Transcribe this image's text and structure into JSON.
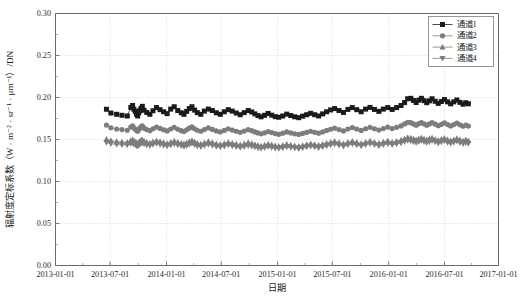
{
  "chart_data": {
    "type": "line",
    "title": "",
    "xlabel": "日期",
    "ylabel": "辐射度定标系数（W · m⁻² · sr⁻¹ · μm⁻¹）/DN",
    "xlim": [
      "2013-01-01",
      "2017-01-01"
    ],
    "ylim": [
      0.0,
      0.3
    ],
    "ytick_labels": [
      "0.00",
      "0.05",
      "0.10",
      "0.15",
      "0.20",
      "0.25",
      "0.30"
    ],
    "ytick_values": [
      0.0,
      0.05,
      0.1,
      0.15,
      0.2,
      0.25,
      0.3
    ],
    "xtick_labels": [
      "2013-01-01",
      "2013-07-01",
      "2014-01-01",
      "2014-07-01",
      "2015-01-01",
      "2015-07-01",
      "2016-01-01",
      "2016-07-01",
      "2017-01-01"
    ],
    "xtick_values": [
      0.0,
      0.1233,
      0.2507,
      0.374,
      0.5014,
      0.6247,
      0.7521,
      0.8781,
      1.0
    ],
    "grid": true,
    "legend_position": "top-right",
    "series": [
      {
        "name": "通道1",
        "marker": "square",
        "color": "#1a1a1a",
        "x": [
          0.115,
          0.125,
          0.138,
          0.15,
          0.162,
          0.17,
          0.174,
          0.177,
          0.18,
          0.183,
          0.1855,
          0.188,
          0.1905,
          0.193,
          0.196,
          0.2,
          0.206,
          0.213,
          0.22,
          0.228,
          0.236,
          0.244,
          0.252,
          0.26,
          0.268,
          0.276,
          0.284,
          0.29,
          0.296,
          0.302,
          0.308,
          0.314,
          0.32,
          0.328,
          0.336,
          0.345,
          0.354,
          0.363,
          0.372,
          0.381,
          0.39,
          0.399,
          0.408,
          0.417,
          0.426,
          0.435,
          0.443,
          0.45,
          0.457,
          0.464,
          0.472,
          0.48,
          0.488,
          0.496,
          0.504,
          0.513,
          0.522,
          0.531,
          0.54,
          0.549,
          0.558,
          0.567,
          0.576,
          0.585,
          0.594,
          0.603,
          0.612,
          0.621,
          0.63,
          0.64,
          0.65,
          0.66,
          0.67,
          0.68,
          0.69,
          0.7,
          0.71,
          0.72,
          0.73,
          0.74,
          0.75,
          0.76,
          0.77,
          0.78,
          0.788,
          0.795,
          0.802,
          0.808,
          0.814,
          0.82,
          0.826,
          0.832,
          0.838,
          0.844,
          0.85,
          0.857,
          0.864,
          0.871,
          0.878,
          0.885,
          0.892,
          0.899,
          0.906,
          0.913,
          0.92,
          0.926,
          0.932
        ],
        "y": [
          0.186,
          0.1815,
          0.18,
          0.1788,
          0.178,
          0.1882,
          0.1905,
          0.186,
          0.1835,
          0.18,
          0.178,
          0.1818,
          0.1845,
          0.187,
          0.1895,
          0.1848,
          0.1822,
          0.18,
          0.1842,
          0.188,
          0.1855,
          0.183,
          0.1808,
          0.1862,
          0.189,
          0.1845,
          0.1818,
          0.18,
          0.1835,
          0.1868,
          0.189,
          0.185,
          0.182,
          0.18,
          0.1838,
          0.1862,
          0.1845,
          0.1818,
          0.18,
          0.183,
          0.1855,
          0.1838,
          0.1815,
          0.1795,
          0.182,
          0.1845,
          0.1828,
          0.1805,
          0.1785,
          0.177,
          0.1788,
          0.181,
          0.179,
          0.1772,
          0.1765,
          0.178,
          0.1802,
          0.1785,
          0.177,
          0.176,
          0.1778,
          0.1795,
          0.1812,
          0.1795,
          0.178,
          0.1805,
          0.183,
          0.1852,
          0.1868,
          0.1845,
          0.1822,
          0.1858,
          0.188,
          0.1855,
          0.183,
          0.1862,
          0.1882,
          0.1858,
          0.1835,
          0.1862,
          0.188,
          0.1858,
          0.188,
          0.1905,
          0.194,
          0.1985,
          0.199,
          0.1965,
          0.194,
          0.1968,
          0.199,
          0.1962,
          0.1938,
          0.196,
          0.1985,
          0.1955,
          0.193,
          0.1952,
          0.1975,
          0.1948,
          0.1925,
          0.1948,
          0.197,
          0.1942,
          0.192,
          0.1938,
          0.1925
        ]
      },
      {
        "name": "通道2",
        "marker": "circle",
        "color": "#7d7d7d",
        "x": [
          0.115,
          0.125,
          0.138,
          0.15,
          0.162,
          0.17,
          0.174,
          0.177,
          0.18,
          0.183,
          0.1855,
          0.188,
          0.1905,
          0.193,
          0.196,
          0.2,
          0.206,
          0.213,
          0.22,
          0.228,
          0.236,
          0.244,
          0.252,
          0.26,
          0.268,
          0.276,
          0.284,
          0.29,
          0.296,
          0.302,
          0.308,
          0.314,
          0.32,
          0.328,
          0.336,
          0.345,
          0.354,
          0.363,
          0.372,
          0.381,
          0.39,
          0.399,
          0.408,
          0.417,
          0.426,
          0.435,
          0.443,
          0.45,
          0.457,
          0.464,
          0.472,
          0.48,
          0.488,
          0.496,
          0.504,
          0.513,
          0.522,
          0.531,
          0.54,
          0.549,
          0.558,
          0.567,
          0.576,
          0.585,
          0.594,
          0.603,
          0.612,
          0.621,
          0.63,
          0.64,
          0.65,
          0.66,
          0.67,
          0.68,
          0.69,
          0.7,
          0.71,
          0.72,
          0.73,
          0.74,
          0.75,
          0.76,
          0.77,
          0.78,
          0.788,
          0.795,
          0.802,
          0.808,
          0.814,
          0.82,
          0.826,
          0.832,
          0.838,
          0.844,
          0.85,
          0.857,
          0.864,
          0.871,
          0.878,
          0.885,
          0.892,
          0.899,
          0.906,
          0.913,
          0.92,
          0.926,
          0.932
        ],
        "y": [
          0.1672,
          0.164,
          0.1625,
          0.1618,
          0.161,
          0.1648,
          0.1662,
          0.164,
          0.1622,
          0.1608,
          0.1598,
          0.1618,
          0.1635,
          0.165,
          0.1662,
          0.1635,
          0.1618,
          0.1605,
          0.1628,
          0.1648,
          0.1632,
          0.1615,
          0.1602,
          0.1625,
          0.1645,
          0.1622,
          0.1605,
          0.1595,
          0.1615,
          0.1635,
          0.165,
          0.1628,
          0.161,
          0.1598,
          0.1618,
          0.1638,
          0.162,
          0.1602,
          0.159,
          0.1608,
          0.1628,
          0.1612,
          0.1598,
          0.1585,
          0.16,
          0.1618,
          0.1605,
          0.159,
          0.1578,
          0.1568,
          0.158,
          0.1595,
          0.1582,
          0.157,
          0.1562,
          0.1575,
          0.159,
          0.1578,
          0.1568,
          0.156,
          0.1572,
          0.1585,
          0.1598,
          0.1585,
          0.1575,
          0.159,
          0.1608,
          0.1622,
          0.1635,
          0.1618,
          0.1602,
          0.1625,
          0.1642,
          0.1625,
          0.1608,
          0.1628,
          0.1645,
          0.1628,
          0.1612,
          0.163,
          0.1648,
          0.163,
          0.1645,
          0.1662,
          0.1685,
          0.1705,
          0.17,
          0.1685,
          0.167,
          0.1688,
          0.1702,
          0.1685,
          0.167,
          0.1685,
          0.1702,
          0.1682,
          0.1665,
          0.168,
          0.1698,
          0.1678,
          0.1662,
          0.1678,
          0.1695,
          0.1675,
          0.1658,
          0.1672,
          0.166
        ]
      },
      {
        "name": "通道3",
        "marker": "triangle-up",
        "color": "#7d7d7d",
        "x": [
          0.115,
          0.125,
          0.138,
          0.15,
          0.162,
          0.17,
          0.174,
          0.177,
          0.18,
          0.183,
          0.1855,
          0.188,
          0.1905,
          0.193,
          0.196,
          0.2,
          0.206,
          0.213,
          0.22,
          0.228,
          0.236,
          0.244,
          0.252,
          0.26,
          0.268,
          0.276,
          0.284,
          0.29,
          0.296,
          0.302,
          0.308,
          0.314,
          0.32,
          0.328,
          0.336,
          0.345,
          0.354,
          0.363,
          0.372,
          0.381,
          0.39,
          0.399,
          0.408,
          0.417,
          0.426,
          0.435,
          0.443,
          0.45,
          0.457,
          0.464,
          0.472,
          0.48,
          0.488,
          0.496,
          0.504,
          0.513,
          0.522,
          0.531,
          0.54,
          0.549,
          0.558,
          0.567,
          0.576,
          0.585,
          0.594,
          0.603,
          0.612,
          0.621,
          0.63,
          0.64,
          0.65,
          0.66,
          0.67,
          0.68,
          0.69,
          0.7,
          0.71,
          0.72,
          0.73,
          0.74,
          0.75,
          0.76,
          0.77,
          0.78,
          0.788,
          0.795,
          0.802,
          0.808,
          0.814,
          0.82,
          0.826,
          0.832,
          0.838,
          0.844,
          0.85,
          0.857,
          0.864,
          0.871,
          0.878,
          0.885,
          0.892,
          0.899,
          0.906,
          0.913,
          0.92,
          0.926,
          0.932
        ],
        "y": [
          0.1505,
          0.1488,
          0.1478,
          0.1472,
          0.1468,
          0.149,
          0.1498,
          0.1485,
          0.1472,
          0.1462,
          0.1455,
          0.1468,
          0.148,
          0.1492,
          0.15,
          0.1482,
          0.147,
          0.146,
          0.1475,
          0.1488,
          0.1478,
          0.1465,
          0.1455,
          0.147,
          0.1485,
          0.147,
          0.1458,
          0.145,
          0.1462,
          0.1478,
          0.149,
          0.1472,
          0.1458,
          0.1448,
          0.1462,
          0.1478,
          0.1465,
          0.1452,
          0.1442,
          0.1455,
          0.147,
          0.1458,
          0.1448,
          0.1438,
          0.145,
          0.1465,
          0.1455,
          0.1442,
          0.1432,
          0.1425,
          0.1435,
          0.1448,
          0.1438,
          0.1428,
          0.1422,
          0.1432,
          0.1445,
          0.1435,
          0.1428,
          0.142,
          0.143,
          0.1442,
          0.1452,
          0.1442,
          0.1432,
          0.1445,
          0.1458,
          0.147,
          0.148,
          0.1465,
          0.1452,
          0.1468,
          0.1482,
          0.1468,
          0.1455,
          0.147,
          0.1485,
          0.147,
          0.1458,
          0.1472,
          0.1485,
          0.147,
          0.1482,
          0.1495,
          0.151,
          0.1525,
          0.152,
          0.1508,
          0.1498,
          0.151,
          0.1522,
          0.1508,
          0.1498,
          0.151,
          0.1522,
          0.1505,
          0.1492,
          0.1505,
          0.1518,
          0.15,
          0.1488,
          0.15,
          0.1515,
          0.1498,
          0.1485,
          0.1498,
          0.1488
        ]
      },
      {
        "name": "通道4",
        "marker": "triangle-down",
        "color": "#7d7d7d",
        "x": [
          0.115,
          0.125,
          0.138,
          0.15,
          0.162,
          0.17,
          0.174,
          0.177,
          0.18,
          0.183,
          0.1855,
          0.188,
          0.1905,
          0.193,
          0.196,
          0.2,
          0.206,
          0.213,
          0.22,
          0.228,
          0.236,
          0.244,
          0.252,
          0.26,
          0.268,
          0.276,
          0.284,
          0.29,
          0.296,
          0.302,
          0.308,
          0.314,
          0.32,
          0.328,
          0.336,
          0.345,
          0.354,
          0.363,
          0.372,
          0.381,
          0.39,
          0.399,
          0.408,
          0.417,
          0.426,
          0.435,
          0.443,
          0.45,
          0.457,
          0.464,
          0.472,
          0.48,
          0.488,
          0.496,
          0.504,
          0.513,
          0.522,
          0.531,
          0.54,
          0.549,
          0.558,
          0.567,
          0.576,
          0.585,
          0.594,
          0.603,
          0.612,
          0.621,
          0.63,
          0.64,
          0.65,
          0.66,
          0.67,
          0.68,
          0.69,
          0.7,
          0.71,
          0.72,
          0.73,
          0.74,
          0.75,
          0.76,
          0.77,
          0.78,
          0.788,
          0.795,
          0.802,
          0.808,
          0.814,
          0.82,
          0.826,
          0.832,
          0.838,
          0.844,
          0.85,
          0.857,
          0.864,
          0.871,
          0.878,
          0.885,
          0.892,
          0.899,
          0.906,
          0.913,
          0.92,
          0.926,
          0.932
        ],
        "y": [
          0.1462,
          0.1448,
          0.144,
          0.1435,
          0.1432,
          0.145,
          0.1458,
          0.1445,
          0.1435,
          0.1425,
          0.142,
          0.143,
          0.1442,
          0.1452,
          0.146,
          0.1445,
          0.1432,
          0.1425,
          0.1438,
          0.145,
          0.144,
          0.1428,
          0.142,
          0.1432,
          0.1445,
          0.1432,
          0.1422,
          0.1415,
          0.1425,
          0.1438,
          0.145,
          0.1435,
          0.1422,
          0.1412,
          0.1425,
          0.1438,
          0.1428,
          0.1415,
          0.1408,
          0.1418,
          0.1432,
          0.142,
          0.1412,
          0.1402,
          0.1412,
          0.1425,
          0.1418,
          0.1408,
          0.1398,
          0.1392,
          0.14,
          0.1412,
          0.1402,
          0.1395,
          0.139,
          0.1398,
          0.141,
          0.1402,
          0.1395,
          0.1388,
          0.1398,
          0.1408,
          0.1418,
          0.1408,
          0.14,
          0.141,
          0.1422,
          0.1432,
          0.1442,
          0.143,
          0.1418,
          0.1432,
          0.1445,
          0.1432,
          0.142,
          0.1435,
          0.1448,
          0.1435,
          0.1422,
          0.1435,
          0.1448,
          0.1435,
          0.1445,
          0.1458,
          0.1472,
          0.1485,
          0.148,
          0.147,
          0.146,
          0.1472,
          0.1482,
          0.147,
          0.146,
          0.1472,
          0.1482,
          0.1468,
          0.1455,
          0.1468,
          0.148,
          0.1462,
          0.1452,
          0.1462,
          0.1478,
          0.146,
          0.1448,
          0.146,
          0.145
        ]
      }
    ]
  }
}
